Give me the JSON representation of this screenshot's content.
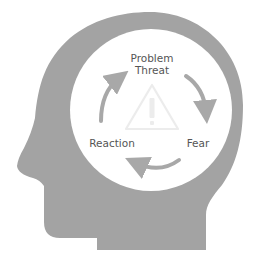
{
  "diagram": {
    "colors": {
      "head": "#a3a3a3",
      "circle": "#ffffff",
      "arrow": "#a8a8a8",
      "text": "#555555",
      "warning": "#ececec"
    },
    "nodes": [
      {
        "id": "problem",
        "lines": [
          "Problem",
          "Threat"
        ]
      },
      {
        "id": "fear",
        "lines": [
          "Fear"
        ]
      },
      {
        "id": "reaction",
        "lines": [
          "Reaction"
        ]
      }
    ],
    "cycle_order": [
      "problem",
      "fear",
      "reaction",
      "problem"
    ],
    "center_icon": "warning-triangle-icon"
  }
}
